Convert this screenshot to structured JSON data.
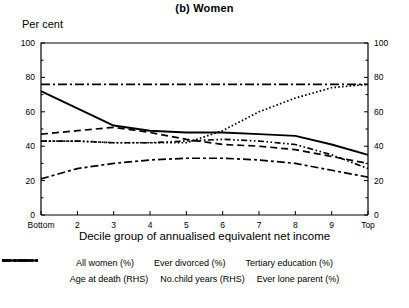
{
  "title": "(b) Women",
  "axis": {
    "ylabel_left": "Per cent",
    "xlabel": "Decile group of annualised equivalent net income",
    "yticks": [
      0,
      20,
      40,
      60,
      80,
      100
    ],
    "yticks_right": [
      0,
      20,
      40,
      60,
      80,
      100
    ],
    "xticks": [
      "Bottom",
      "2",
      "3",
      "4",
      "5",
      "6",
      "7",
      "8",
      "9",
      "Top"
    ]
  },
  "legend": {
    "row1": [
      {
        "label": "All women (%)",
        "style": "solid"
      },
      {
        "label": "Ever divorced (%)",
        "style": "dashed"
      },
      {
        "label": "Tertiary education (%)",
        "style": "dotted"
      }
    ],
    "row2": [
      {
        "label": "Age at death (RHS)",
        "style": "dashdot"
      },
      {
        "label": "No.child years (RHS)",
        "style": "dashdotdot"
      },
      {
        "label": "Ever lone parent (%)",
        "style": "longdashdot"
      }
    ]
  },
  "chart_data": {
    "type": "line",
    "title": "(b) Women",
    "xlabel": "Decile group of annualised equivalent net income",
    "ylabel": "Per cent",
    "ylim": [
      0,
      100
    ],
    "ylim_right": [
      0,
      100
    ],
    "grid": false,
    "legend_position": "bottom",
    "categories": [
      "Bottom",
      "2",
      "3",
      "4",
      "5",
      "6",
      "7",
      "8",
      "9",
      "Top"
    ],
    "series": [
      {
        "name": "All women (%)",
        "style": "solid",
        "values": [
          72,
          62,
          52,
          49,
          48,
          48,
          47,
          46,
          41,
          35
        ]
      },
      {
        "name": "Ever divorced (%)",
        "style": "dashed",
        "values": [
          47,
          49,
          51,
          48,
          44,
          41,
          40,
          38,
          34,
          30
        ]
      },
      {
        "name": "Tertiary education (%)",
        "style": "dotted",
        "values": [
          43,
          43,
          42,
          42,
          42,
          49,
          60,
          68,
          74,
          76
        ]
      },
      {
        "name": "Age at death (RHS)",
        "style": "dashdot",
        "values": [
          76,
          76,
          76,
          76,
          76,
          76,
          76,
          76,
          76,
          76
        ]
      },
      {
        "name": "No.child years (RHS)",
        "style": "dashdotdot",
        "values": [
          43,
          43,
          42,
          42,
          43,
          44,
          43,
          41,
          35,
          27
        ]
      },
      {
        "name": "Ever lone parent (%)",
        "style": "longdashdot",
        "values": [
          21,
          27,
          30,
          32,
          33,
          33,
          32,
          30,
          26,
          22
        ]
      }
    ]
  }
}
